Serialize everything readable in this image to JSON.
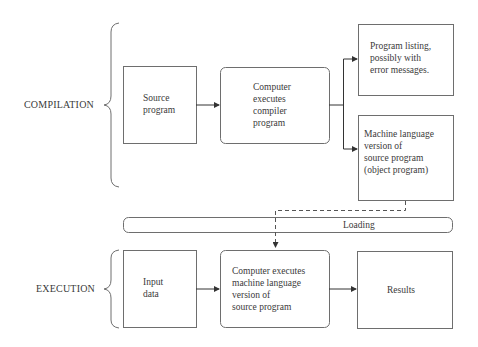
{
  "sections": {
    "compilation": "COMPILATION",
    "execution": "EXECUTION"
  },
  "nodes": {
    "source_program": [
      "Source",
      "program"
    ],
    "compiler": [
      "Computer",
      "executes",
      "compiler",
      "program"
    ],
    "listing": [
      "Program listing,",
      "possibly with",
      "error messages."
    ],
    "object_program": [
      "Machine language",
      "version of",
      "source program",
      "(object program)"
    ],
    "loading": "Loading",
    "input_data": [
      "Input",
      "data"
    ],
    "execute": [
      "Computer executes",
      "machine language",
      "version of",
      "source program"
    ],
    "results": "Results"
  },
  "colors": {
    "stroke": "#6e6e6e",
    "text": "#3a3a3a",
    "background": "#ffffff"
  }
}
